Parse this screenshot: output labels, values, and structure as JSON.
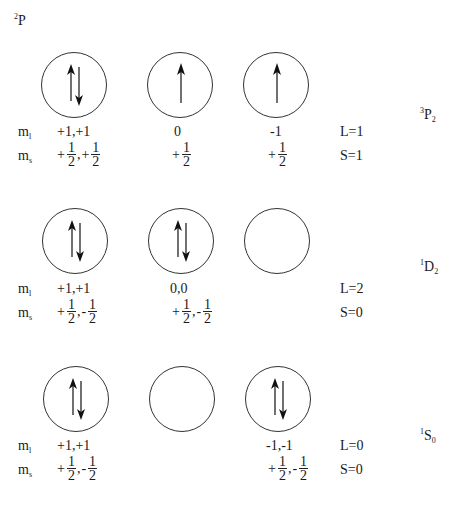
{
  "header": {
    "config_sup": "2",
    "config_letter": "P"
  },
  "rows": [
    {
      "term": {
        "sup": "3",
        "letter": "P",
        "sub": "2"
      },
      "orbitals": [
        "up-down",
        "up",
        "up"
      ],
      "ml_label": "m",
      "ml_sub": "l",
      "ms_label": "m",
      "ms_sub": "s",
      "ml": [
        "+1,+1",
        "0",
        "-1"
      ],
      "ms": [
        {
          "parts": [
            {
              "sign": "+",
              "num": "1",
              "den": "2"
            },
            {
              "sign": "+",
              "num": "1",
              "den": "2"
            }
          ]
        },
        {
          "parts": [
            {
              "sign": "+",
              "num": "1",
              "den": "2"
            }
          ]
        },
        {
          "parts": [
            {
              "sign": "+",
              "num": "1",
              "den": "2"
            }
          ]
        }
      ],
      "L": "L=1",
      "S": "S=1"
    },
    {
      "term": {
        "sup": "1",
        "letter": "D",
        "sub": "2"
      },
      "orbitals": [
        "up-down",
        "up-down",
        "empty"
      ],
      "ml_label": "m",
      "ml_sub": "l",
      "ms_label": "m",
      "ms_sub": "s",
      "ml": [
        "+1,+1",
        "0,0",
        ""
      ],
      "ms": [
        {
          "parts": [
            {
              "sign": "+",
              "num": "1",
              "den": "2"
            },
            {
              "sign": "-",
              "num": "1",
              "den": "2"
            }
          ]
        },
        {
          "parts": [
            {
              "sign": "+",
              "num": "1",
              "den": "2"
            },
            {
              "sign": "-",
              "num": "1",
              "den": "2"
            }
          ]
        },
        {
          "parts": []
        }
      ],
      "L": "L=2",
      "S": "S=0"
    },
    {
      "term": {
        "sup": "1",
        "letter": "S",
        "sub": "0"
      },
      "orbitals": [
        "up-down",
        "empty",
        "up-down"
      ],
      "ml_label": "m",
      "ml_sub": "l",
      "ms_label": "m",
      "ms_sub": "s",
      "ml": [
        "+1,+1",
        "",
        "-1,-1"
      ],
      "ms": [
        {
          "parts": [
            {
              "sign": "+",
              "num": "1",
              "den": "2"
            },
            {
              "sign": "-",
              "num": "1",
              "den": "2"
            }
          ]
        },
        {
          "parts": []
        },
        {
          "parts": [
            {
              "sign": "+",
              "num": "1",
              "den": "2"
            },
            {
              "sign": "-",
              "num": "1",
              "den": "2"
            }
          ]
        }
      ],
      "L": "L=0",
      "S": "S=0"
    }
  ]
}
